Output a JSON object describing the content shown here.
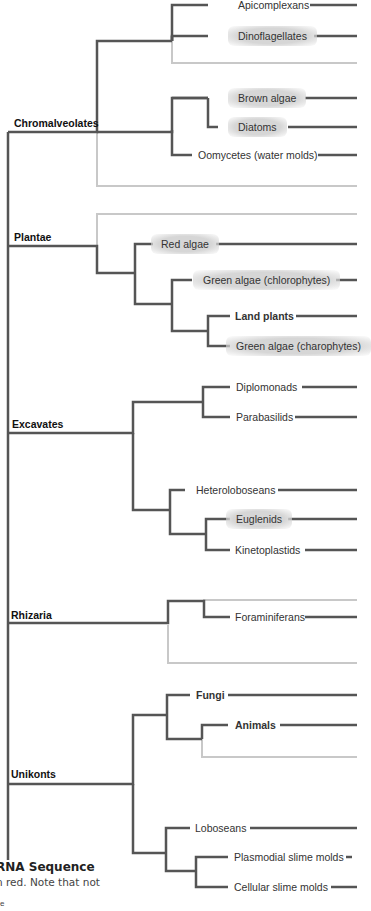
{
  "groups": [
    {
      "id": "chromalveolates",
      "label": "Chromalveolates"
    },
    {
      "id": "plantae",
      "label": "Plantae"
    },
    {
      "id": "excavates",
      "label": "Excavates"
    },
    {
      "id": "rhizaria",
      "label": "Rhizaria"
    },
    {
      "id": "unikonts",
      "label": "Unikonts"
    }
  ],
  "taxa": [
    {
      "label": "Apicomplexans",
      "group": "Chromalveolates",
      "highlighted": false,
      "bold": false
    },
    {
      "label": "Dinoflagellates",
      "group": "Chromalveolates",
      "highlighted": true,
      "bold": false
    },
    {
      "label": "Brown algae",
      "group": "Chromalveolates",
      "highlighted": true,
      "bold": false
    },
    {
      "label": "Diatoms",
      "group": "Chromalveolates",
      "highlighted": true,
      "bold": false
    },
    {
      "label": "Oomycetes (water molds)",
      "group": "Chromalveolates",
      "highlighted": false,
      "bold": false
    },
    {
      "label": "Red algae",
      "group": "Plantae",
      "highlighted": true,
      "bold": false
    },
    {
      "label": "Green algae (chlorophytes)",
      "group": "Plantae",
      "highlighted": true,
      "bold": false
    },
    {
      "label": "Land plants",
      "group": "Plantae",
      "highlighted": false,
      "bold": true
    },
    {
      "label": "Green algae (charophytes)",
      "group": "Plantae",
      "highlighted": true,
      "bold": false
    },
    {
      "label": "Diplomonads",
      "group": "Excavates",
      "highlighted": false,
      "bold": false
    },
    {
      "label": "Parabasilids",
      "group": "Excavates",
      "highlighted": false,
      "bold": false
    },
    {
      "label": "Heteroloboseans",
      "group": "Excavates",
      "highlighted": false,
      "bold": false
    },
    {
      "label": "Euglenids",
      "group": "Excavates",
      "highlighted": true,
      "bold": false
    },
    {
      "label": "Kinetoplastids",
      "group": "Excavates",
      "highlighted": false,
      "bold": false
    },
    {
      "label": "Foraminiferans",
      "group": "Rhizaria",
      "highlighted": false,
      "bold": false
    },
    {
      "label": "Fungi",
      "group": "Unikonts",
      "highlighted": false,
      "bold": true
    },
    {
      "label": "Animals",
      "group": "Unikonts",
      "highlighted": false,
      "bold": true
    },
    {
      "label": "Loboseans",
      "group": "Unikonts",
      "highlighted": false,
      "bold": false
    },
    {
      "label": "Plasmodial slime molds",
      "group": "Unikonts",
      "highlighted": false,
      "bold": false
    },
    {
      "label": "Cellular slime molds",
      "group": "Unikonts",
      "highlighted": false,
      "bold": false
    }
  ],
  "caption": {
    "title": "RNA Sequence",
    "text": "n red. Note that not",
    "fragment": "e"
  },
  "colors": {
    "branch": "#555555",
    "faded_branch": "#c8c8c8",
    "highlight": "#d6d6d6"
  }
}
